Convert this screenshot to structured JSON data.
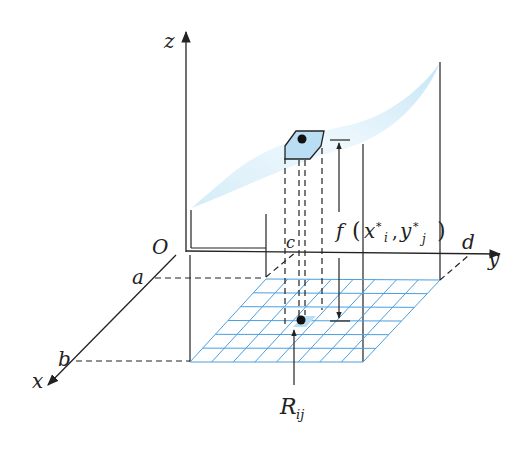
{
  "figure": {
    "type": "double-integral-riemann-sum-illustration",
    "labels": {
      "z_axis": "z",
      "y_axis": "y",
      "x_axis": "x",
      "origin": "O",
      "a": "a",
      "b": "b",
      "c": "c",
      "d": "d",
      "height_label_f": "f",
      "height_label_args": "x*i, y*j",
      "height_label_x": "x",
      "height_label_star1": "*",
      "height_label_i": "i",
      "height_label_y": "y",
      "height_label_star2": "*",
      "height_label_j": "j",
      "region_label_R": "R",
      "region_label_sub": "ij"
    },
    "grid": {
      "rows": 6,
      "cols": 8
    },
    "colors": {
      "surface": "#cde9f7",
      "grid_line": "#4a9fe0",
      "column_top": "#b9ddf2",
      "ink": "#222222"
    }
  }
}
